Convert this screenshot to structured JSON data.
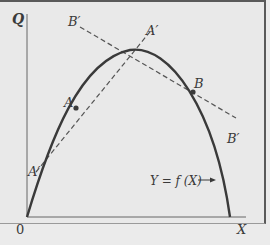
{
  "figure": {
    "axes": {
      "y_label": "Q",
      "x_label": "X",
      "origin_label": "0"
    },
    "curve_label": "Y = f (X)",
    "points": [
      {
        "name": "A",
        "label": "A"
      },
      {
        "name": "B",
        "label": "B"
      }
    ],
    "tangent_lines": [
      {
        "name": "A-prime",
        "label_top": "A′",
        "label_bottom": "A′"
      },
      {
        "name": "B-prime",
        "label_top": "B′",
        "label_bottom": "B′"
      }
    ],
    "colors": {
      "background": "#e9e9e9",
      "curve": "#3a3a3a",
      "dashed": "#555555",
      "axes": "#666666"
    }
  }
}
